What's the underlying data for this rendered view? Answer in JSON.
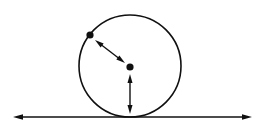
{
  "figure": {
    "title": "Circle rolling on a straight line",
    "background_color": "#ffffff",
    "stroke_color": "#101010",
    "width": 266,
    "height": 132
  },
  "diagram_data": {
    "type": "geometric-diagram",
    "canvas": {
      "width": 266,
      "height": 132
    },
    "circle": {
      "label": "circle",
      "center_x": 130,
      "center_y": 66,
      "radius": 51,
      "stroke_width": 1.6,
      "fill": "none"
    },
    "points": [
      {
        "name": "center-point",
        "label": "center dot",
        "x": 130,
        "y": 67,
        "radius": 3.6
      },
      {
        "name": "rim-point",
        "label": "point on circle",
        "x": 90,
        "y": 35,
        "radius": 3.6
      }
    ],
    "arrows": [
      {
        "name": "radius-arrow",
        "label": "radius vector arrow",
        "x1": 95,
        "y1": 40,
        "x2": 125,
        "y2": 63,
        "double_headed": true,
        "stroke_width": 1.4,
        "head_length": 9,
        "head_width": 5
      },
      {
        "name": "vertical-arrow",
        "label": "vertical radius arrow",
        "x1": 130,
        "y1": 74,
        "x2": 130,
        "y2": 114,
        "double_headed": true,
        "stroke_width": 1.4,
        "head_length": 9,
        "head_width": 5
      },
      {
        "name": "ground-line-arrow",
        "label": "horizontal ground line",
        "x1": 13,
        "y1": 117,
        "x2": 252,
        "y2": 117,
        "double_headed": true,
        "stroke_width": 1.6,
        "head_length": 10,
        "head_width": 5.5
      }
    ],
    "tangent_point": {
      "x": 130,
      "y": 117
    },
    "annotations": [],
    "labels": []
  }
}
